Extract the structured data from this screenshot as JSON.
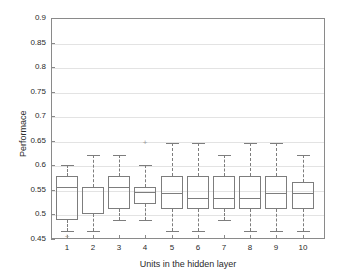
{
  "chart_data": {
    "type": "box",
    "title": "",
    "xlabel": "Units in the hidden layer",
    "ylabel": "Performace",
    "xlim": [
      0.4,
      10.85
    ],
    "ylim": [
      0.45,
      0.9
    ],
    "yticks": [
      0.45,
      0.5,
      0.55,
      0.6,
      0.65,
      0.7,
      0.75,
      0.8,
      0.85,
      0.9
    ],
    "ytick_labels": [
      "0.45",
      "0.5",
      "0.55",
      "0.6",
      "0.65",
      "0.7",
      "0.75",
      "0.8",
      "0.85",
      "0.9"
    ],
    "xticks": [
      1,
      2,
      3,
      4,
      5,
      6,
      7,
      8,
      9,
      10
    ],
    "xtick_labels": [
      "1",
      "2",
      "3",
      "4",
      "5",
      "6",
      "7",
      "8",
      "9",
      "10"
    ],
    "grid": true,
    "legend": null,
    "box_color": "#7d7d7d",
    "grid_color": "#e3e3e3",
    "axis_color": "#8a8a8a",
    "categories": [
      "1",
      "2",
      "3",
      "4",
      "5",
      "6",
      "7",
      "8",
      "9",
      "10"
    ],
    "boxes": [
      {
        "category": "1",
        "whisker_low": 0.467,
        "q1": 0.488,
        "median": 0.555,
        "q3": 0.578,
        "whisker_high": 0.6,
        "outliers": [
          0.455
        ]
      },
      {
        "category": "2",
        "whisker_low": 0.467,
        "q1": 0.5,
        "median": 0.555,
        "q3": 0.555,
        "whisker_high": 0.622,
        "outliers": []
      },
      {
        "category": "3",
        "whisker_low": 0.489,
        "q1": 0.512,
        "median": 0.555,
        "q3": 0.578,
        "whisker_high": 0.622,
        "outliers": []
      },
      {
        "category": "4",
        "whisker_low": 0.489,
        "q1": 0.522,
        "median": 0.545,
        "q3": 0.555,
        "whisker_high": 0.6,
        "outliers": [
          0.645
        ]
      },
      {
        "category": "5",
        "whisker_low": 0.467,
        "q1": 0.511,
        "median": 0.543,
        "q3": 0.578,
        "whisker_high": 0.645,
        "outliers": []
      },
      {
        "category": "6",
        "whisker_low": 0.467,
        "q1": 0.511,
        "median": 0.533,
        "q3": 0.578,
        "whisker_high": 0.645,
        "outliers": []
      },
      {
        "category": "7",
        "whisker_low": 0.489,
        "q1": 0.511,
        "median": 0.533,
        "q3": 0.578,
        "whisker_high": 0.622,
        "outliers": []
      },
      {
        "category": "8",
        "whisker_low": 0.467,
        "q1": 0.511,
        "median": 0.533,
        "q3": 0.578,
        "whisker_high": 0.645,
        "outliers": []
      },
      {
        "category": "9",
        "whisker_low": 0.467,
        "q1": 0.511,
        "median": 0.543,
        "q3": 0.578,
        "whisker_high": 0.645,
        "outliers": []
      },
      {
        "category": "10",
        "whisker_low": 0.467,
        "q1": 0.511,
        "median": 0.543,
        "q3": 0.566,
        "whisker_high": 0.622,
        "outliers": []
      }
    ]
  }
}
